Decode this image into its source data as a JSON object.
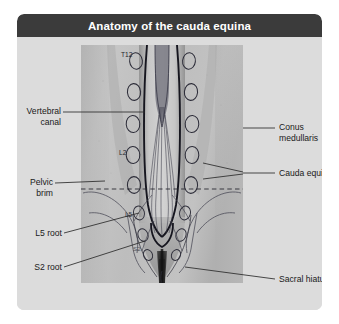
{
  "figure": {
    "title": "Anatomy of the cauda equina",
    "colors": {
      "title_bar": "#3b3b3b",
      "title_text": "#ffffff",
      "card_background": "#dcdcdc",
      "label_text": "#1a1a1a",
      "leader_line": "#2b2b2b",
      "ink_outline": "#1f1f2b",
      "radiograph_light": "#c4c4c4",
      "radiograph_dark": "#5a5a5a"
    }
  },
  "labels": {
    "left": [
      {
        "text_line1": "Vertebral",
        "text_line2": "canal",
        "name": "vertebral-canal"
      },
      {
        "text_line1": "Pelvic",
        "text_line2": "brim",
        "name": "pelvic-brim"
      },
      {
        "text_line1": "L5 root",
        "text_line2": "",
        "name": "l5-root"
      },
      {
        "text_line1": "S2 root",
        "text_line2": "",
        "name": "s2-root"
      }
    ],
    "right": [
      {
        "text_line1": "Conus",
        "text_line2": "medullaris",
        "name": "conus-medullaris"
      },
      {
        "text_line1": "Cauda equina",
        "text_line2": "",
        "name": "cauda-equina"
      },
      {
        "text_line1": "Sacral hiatus",
        "text_line2": "",
        "name": "sacral-hiatus"
      }
    ]
  },
  "vertebral_levels": [
    {
      "label": "T12",
      "name": "level-marker-t12"
    },
    {
      "label": "L2",
      "name": "level-marker-l2"
    },
    {
      "label": "L5",
      "name": "level-marker-l5"
    },
    {
      "label": "S2",
      "name": "level-marker-s2"
    }
  ]
}
